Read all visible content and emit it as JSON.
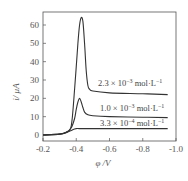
{
  "chart_data": {
    "type": "line",
    "title": "",
    "xlabel": "φ /V",
    "ylabel": "i/ μA",
    "xlim": [
      -0.2,
      -1.0
    ],
    "ylim": [
      -3,
      68
    ],
    "x_ticks": [
      -0.2,
      -0.4,
      -0.6,
      -0.8,
      -1.0
    ],
    "x_tick_labels": [
      "-0.2",
      "-0.4",
      "-0.6",
      "-0.8",
      "-1.0"
    ],
    "y_ticks": [
      0,
      10,
      20,
      30,
      40,
      50,
      60
    ],
    "y_tick_labels": [
      "0",
      "10",
      "20",
      "30",
      "40",
      "50",
      "60"
    ],
    "grid": false,
    "legend_position": "inline labels right of curves",
    "series": [
      {
        "name": "2.3 × 10⁻³ mol·L⁻¹",
        "x": [
          -0.2,
          -0.3,
          -0.34,
          -0.37,
          -0.39,
          -0.41,
          -0.42,
          -0.43,
          -0.44,
          -0.45,
          -0.46,
          -0.47,
          -0.48,
          -0.5,
          -0.6,
          -0.8,
          -0.95
        ],
        "y": [
          0,
          0.5,
          1.5,
          5,
          25,
          50,
          60,
          64,
          62,
          50,
          35,
          27,
          25,
          24,
          23,
          22.5,
          22
        ]
      },
      {
        "name": "1.0 × 10⁻³ mol·L⁻¹",
        "x": [
          -0.2,
          -0.3,
          -0.34,
          -0.37,
          -0.39,
          -0.4,
          -0.41,
          -0.42,
          -0.43,
          -0.44,
          -0.45,
          -0.47,
          -0.5,
          -0.6,
          -0.8,
          -0.95
        ],
        "y": [
          0,
          0.5,
          1.5,
          4,
          9,
          14,
          18,
          20,
          18,
          15,
          12.5,
          11,
          10.5,
          10,
          9.7,
          9.5
        ]
      },
      {
        "name": "3.3 × 10⁻⁴ mol·L⁻¹",
        "x": [
          -0.2,
          -0.3,
          -0.34,
          -0.37,
          -0.39,
          -0.4,
          -0.42,
          -0.5,
          -0.7,
          -0.95
        ],
        "y": [
          0,
          0.5,
          1.3,
          2.5,
          3.3,
          3.5,
          3.5,
          3.5,
          3.5,
          3.5
        ]
      }
    ],
    "annotations": [
      {
        "text": "2.3 × 10⁻³ mol·L⁻¹",
        "near_series": 0
      },
      {
        "text": "1.0 × 10⁻³ mol·L⁻¹",
        "near_series": 1
      },
      {
        "text": "3.3 × 10⁻⁴ mol·L⁻¹",
        "near_series": 2
      }
    ]
  },
  "labels": {
    "y_axis": "i/ μA",
    "x_axis": "φ /V",
    "legend": [
      {
        "mantissa": "2.3 × 10",
        "exp": "−3",
        "unit": " mol·L",
        "unit_exp": "−1"
      },
      {
        "mantissa": "1.0 × 10",
        "exp": "−3",
        "unit": " mol·L",
        "unit_exp": "−1"
      },
      {
        "mantissa": "3.3 × 10",
        "exp": "−4",
        "unit": " mol·L",
        "unit_exp": "−1"
      }
    ]
  },
  "colors": {
    "line": "#333333",
    "axis": "#555555",
    "text": "#555555"
  }
}
